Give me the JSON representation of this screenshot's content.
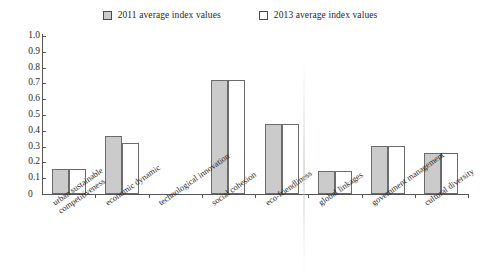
{
  "chart_data": {
    "type": "bar",
    "title": "",
    "subtitle": "",
    "xlabel": "",
    "ylabel": "",
    "ylim": [
      0,
      1.0
    ],
    "ytick_labels": [
      "0",
      "0.1",
      "0.2",
      "0.3",
      "0.4",
      "0.5",
      "0.6",
      "0.7",
      "0.8",
      "0.9",
      "1.0"
    ],
    "ytick_values": [
      0,
      0.1,
      0.2,
      0.3,
      0.4,
      0.5,
      0.6,
      0.7,
      0.8,
      0.9,
      1.0
    ],
    "grid": false,
    "legend_position": "top-center",
    "categories": [
      "urban sustainable competitiveness",
      "economic dynamic",
      "technological innovation",
      "social cohesion",
      "eco-friendliness",
      "global linkages",
      "government management",
      "cultural diversity"
    ],
    "category_lines": [
      [
        "urban sustainable",
        "competitiveness"
      ],
      [
        "economic dynamic",
        ""
      ],
      [
        "technological innovation",
        ""
      ],
      [
        "social cohesion",
        ""
      ],
      [
        "eco-friendliness",
        ""
      ],
      [
        "global linkages",
        ""
      ],
      [
        "government management",
        ""
      ],
      [
        "cultural diversity",
        ""
      ]
    ],
    "series": [
      {
        "name": "2011 average index values",
        "color": "#cbcbcb",
        "values": [
          0.16,
          0.365,
          0.0,
          0.72,
          0.445,
          0.145,
          0.305,
          0.26
        ]
      },
      {
        "name": "2013 average index values",
        "color": "#ffffff",
        "values": [
          0.16,
          0.32,
          0.0,
          0.72,
          0.44,
          0.145,
          0.305,
          0.26
        ]
      }
    ]
  },
  "legend": {
    "entries": [
      {
        "label": "2011 average index values",
        "swatch": "filled-gray-square"
      },
      {
        "label": "2013 average index values",
        "swatch": "hollow-white-square"
      }
    ]
  },
  "axes": {
    "zero_label": "0"
  },
  "colors": {
    "series_2011_fill": "#cbcbcb",
    "series_2013_fill": "#ffffff",
    "bar_border": "#6b6b6b",
    "axis": "#555555",
    "text": "#1f1f1f",
    "background": "#ffffff"
  }
}
